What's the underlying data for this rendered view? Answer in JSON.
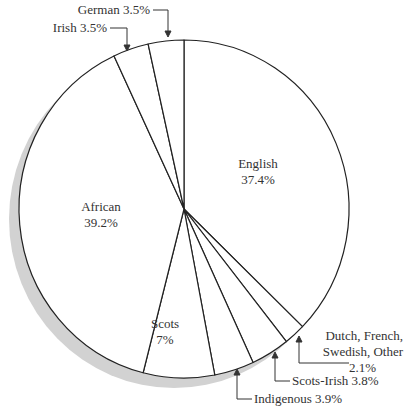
{
  "chart_data": {
    "type": "pie",
    "title": "",
    "start_angle_deg": 0,
    "direction": "clockwise",
    "slices": [
      {
        "label": "English",
        "value": 37.4,
        "display": "37.4%"
      },
      {
        "label": "Dutch, French, Swedish, Other",
        "value": 2.1,
        "display": "2.1%"
      },
      {
        "label": "Scots-Irish",
        "value": 3.8,
        "display": "3.8%"
      },
      {
        "label": "Indigenous",
        "value": 3.9,
        "display": "3.9%"
      },
      {
        "label": "Scots",
        "value": 7.0,
        "display": "7%"
      },
      {
        "label": "African",
        "value": 39.2,
        "display": "39.2%"
      },
      {
        "label": "Irish",
        "value": 3.5,
        "display": "3.5%"
      },
      {
        "label": "German",
        "value": 3.5,
        "display": "3.5%"
      }
    ],
    "colors": {
      "fill": "#ffffff",
      "stroke": "#222222",
      "shadow": "#cfcfcf"
    }
  },
  "labels": {
    "english": {
      "name": "English",
      "pct": "37.4%"
    },
    "african": {
      "name": "African",
      "pct": "39.2%"
    },
    "scots": {
      "name": "Scots",
      "pct": "7%"
    },
    "dutch": {
      "line1": "Dutch, French,",
      "line2": "Swedish, Other",
      "pct": "2.1%"
    },
    "scots_irish": "Scots-Irish  3.8%",
    "indigenous": "Indigenous  3.9%",
    "irish": "Irish  3.5%",
    "german": "German  3.5%"
  }
}
